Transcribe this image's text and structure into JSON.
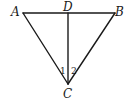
{
  "diagram": {
    "type": "geometry-triangle",
    "points": {
      "A": {
        "label": "A",
        "x": 23,
        "y": 13
      },
      "B": {
        "label": "B",
        "x": 115,
        "y": 13
      },
      "C": {
        "label": "C",
        "x": 68,
        "y": 84
      },
      "D": {
        "label": "D",
        "x": 68,
        "y": 13
      }
    },
    "segments": [
      {
        "id": "AB",
        "from": "A",
        "to": "B"
      },
      {
        "id": "AC",
        "from": "A",
        "to": "C"
      },
      {
        "id": "BC",
        "from": "B",
        "to": "C"
      },
      {
        "id": "CD",
        "from": "C",
        "to": "D"
      }
    ],
    "angles": [
      {
        "label": "1",
        "vertex": "C",
        "between": [
          "CA",
          "CD"
        ]
      },
      {
        "label": "2",
        "vertex": "C",
        "between": [
          "CD",
          "CB"
        ]
      }
    ],
    "colors": {
      "stroke": "#1a1a1a",
      "background": "#ffffff"
    }
  }
}
